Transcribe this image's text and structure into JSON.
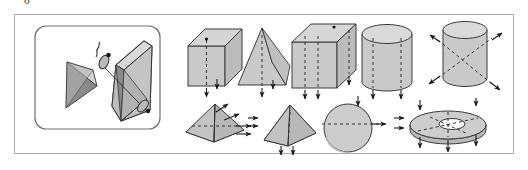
{
  "figure": {
    "figure_number": "6",
    "background_color": "#ffffff",
    "border_color": "#a9a9a9",
    "solid_fill": "#c9c9c9",
    "solid_fill_dark": "#8a8a8a",
    "solid_fill_light": "#dcdcdc",
    "outline_color": "#3a3a3a",
    "dash_color": "#333333",
    "arrow_color": "#1a1a1a",
    "inset": {
      "name": "cube-with-cut-corner-inset",
      "description": "Rounded rectangle inset showing a cube with one corner sliced off and the removed tetrahedral corner piece floating beside it",
      "border_color": "#6e6e6e",
      "corner_radius": "10"
    },
    "solids": [
      {
        "id": "triangular-prism",
        "label": "triangular prism",
        "row": "top",
        "symmetry": "vertical plane",
        "marker": "dashed vertical line with down arrows"
      },
      {
        "id": "tetrahedron-upright",
        "label": "tetrahedron",
        "row": "top",
        "symmetry": "vertical plane",
        "marker": "dashed vertical line with down arrow"
      },
      {
        "id": "cuboid",
        "label": "cuboid",
        "row": "top",
        "symmetry": "vertical planes",
        "marker": "dashed vertical lines with down arrows"
      },
      {
        "id": "cylinder-upright",
        "label": "cylinder",
        "row": "top",
        "symmetry": "vertical axis",
        "marker": "dashed vertical lines with down arrows"
      },
      {
        "id": "cylinder-oblique",
        "label": "cylinder",
        "row": "top",
        "symmetry": "oblique axes",
        "marker": "crossed dashed diagonals with four arrows"
      },
      {
        "id": "square-pyramid-oblique",
        "label": "square pyramid",
        "row": "bottom",
        "symmetry": "diagonal planes",
        "marker": "dashed diagonals with arrows to the right"
      },
      {
        "id": "square-pyramid-upright",
        "label": "square pyramid",
        "row": "bottom",
        "symmetry": "vertical plane",
        "marker": "dashed vertical line with down arrows"
      },
      {
        "id": "sphere",
        "label": "sphere",
        "row": "bottom",
        "symmetry": "horizontal plane",
        "marker": "dashed horizontal line with arrows"
      },
      {
        "id": "annulus-disc",
        "label": "disc with circular hole",
        "row": "bottom",
        "symmetry": "radial axes",
        "marker": "dashed radial lines with arrows all round"
      }
    ]
  }
}
